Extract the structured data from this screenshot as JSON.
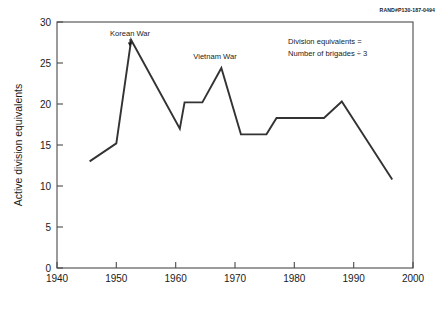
{
  "doc_id": "RAND#P130-187-0494",
  "chart_data": {
    "type": "line",
    "title": "",
    "xlabel": "",
    "ylabel": "Active division equivalents",
    "xlim": [
      1940,
      2000
    ],
    "ylim": [
      0,
      30
    ],
    "xticks": [
      1940,
      1950,
      1960,
      1970,
      1980,
      1990,
      2000
    ],
    "xtick_labels": [
      "1940",
      "1950",
      "1960",
      "1970",
      "1980",
      "1990",
      "2000"
    ],
    "yticks": [
      0,
      5,
      10,
      15,
      20,
      25,
      30
    ],
    "ytick_labels": [
      "0",
      "5",
      "10",
      "15",
      "20",
      "25",
      "30"
    ],
    "grid": false,
    "legend": false,
    "line_color": "#333333",
    "series": [
      {
        "name": "Active division equivalents",
        "x": [
          1945.5,
          1950.0,
          1952.5,
          1960.7,
          1961.5,
          1964.5,
          1967.7,
          1971.0,
          1975.3,
          1977.0,
          1985.0,
          1988.0,
          1996.5
        ],
        "values": [
          13.0,
          15.2,
          27.8,
          17.0,
          20.2,
          20.2,
          24.4,
          16.3,
          16.3,
          18.3,
          18.3,
          20.3,
          10.8
        ]
      }
    ],
    "annotations": [
      {
        "name": "korean-war",
        "text": "Korean War",
        "x": 1952.5,
        "y": 29.0,
        "has_pointer": true
      },
      {
        "name": "vietnam-war",
        "text": "Vietnam War",
        "x": 1967.7,
        "y": 26.2,
        "has_pointer": false
      }
    ],
    "note_lines": [
      "Division equivalents =",
      "Number of brigades ÷ 3"
    ]
  }
}
